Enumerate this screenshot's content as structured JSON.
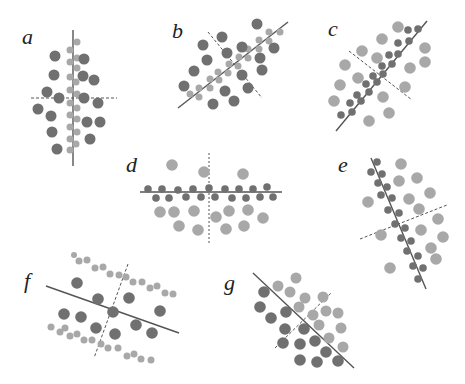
{
  "panels": [
    {
      "label": "a"
    },
    {
      "label": "b"
    },
    {
      "label": "c"
    },
    {
      "label": "d"
    },
    {
      "label": "e"
    },
    {
      "label": "f"
    },
    {
      "label": "g"
    }
  ],
  "colors": {
    "dark_dot": "#707070",
    "light_dot": "#a8a8a8",
    "line": "#555555",
    "dashed_line": "#666666"
  }
}
